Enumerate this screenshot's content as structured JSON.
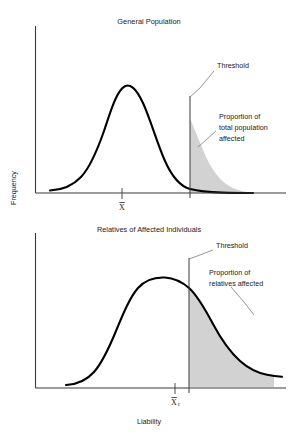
{
  "figure": {
    "xlabel": "Liability",
    "ylabel": "Frequency"
  },
  "panels": [
    {
      "title": "General Population",
      "threshold_label": "Threshold",
      "region_label_line1": "Proportion of",
      "region_label_line2": "total population",
      "region_label_line3": "affected",
      "mean_label": "X",
      "mean_subscript": ""
    },
    {
      "title": "Relatives of Affected Individuals",
      "threshold_label": "Threshold",
      "region_label_line1": "Proportion of",
      "region_label_line2": "relatives affected",
      "region_label_line3": "",
      "mean_label": "X",
      "mean_subscript": "r"
    }
  ],
  "chart_data": {
    "type": "line",
    "xlabel": "Liability",
    "ylabel": "Frequency",
    "grid": false,
    "legend": "none",
    "xlim": [
      0,
      100
    ],
    "ylim": [
      0,
      1
    ],
    "colors": {
      "curve": "#000000",
      "shaded_region": "#d2d2d2",
      "axis": "#3a3a3a",
      "leader": "#6a6a6a",
      "background": "#ffffff"
    },
    "series": [
      {
        "name": "General Population",
        "panel": 1,
        "distribution": "normal",
        "mean_x": 46,
        "mean_label": "X̄",
        "sd": 15,
        "threshold_x": 77,
        "threshold_label": "Threshold",
        "shaded_tail": "right",
        "shaded_annotation": "Proportion of total population affected",
        "x": [
          10,
          16,
          22,
          28,
          34,
          40,
          46,
          52,
          58,
          64,
          70,
          77,
          83,
          89,
          95
        ],
        "y": [
          0.02,
          0.05,
          0.14,
          0.33,
          0.61,
          0.88,
          1.0,
          0.93,
          0.72,
          0.47,
          0.26,
          0.11,
          0.05,
          0.02,
          0.01
        ]
      },
      {
        "name": "Relatives of Affected Individuals",
        "panel": 2,
        "distribution": "normal",
        "mean_x": 62,
        "mean_label": "X̄r",
        "sd": 15,
        "threshold_x": 77,
        "threshold_label": "Threshold",
        "shaded_tail": "right",
        "shaded_annotation": "Proportion of relatives affected",
        "x": [
          22,
          28,
          34,
          40,
          46,
          52,
          58,
          62,
          68,
          74,
          80,
          86,
          92,
          96
        ],
        "y": [
          0.03,
          0.08,
          0.19,
          0.38,
          0.62,
          0.86,
          0.98,
          1.0,
          0.92,
          0.74,
          0.52,
          0.31,
          0.14,
          0.06
        ]
      }
    ],
    "annotations": [
      {
        "text": "Threshold",
        "panel": 1,
        "points_to": "threshold-line-1"
      },
      {
        "text": "Proportion of total population affected",
        "panel": 1,
        "points_to": "shaded-area-1"
      },
      {
        "text": "Threshold",
        "panel": 2,
        "points_to": "threshold-line-2"
      },
      {
        "text": "Proportion of relatives affected",
        "panel": 2,
        "points_to": "shaded-area-2"
      }
    ]
  }
}
